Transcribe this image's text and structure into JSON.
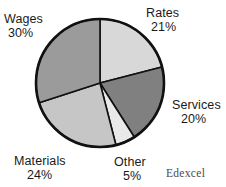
{
  "chart_data": {
    "type": "pie",
    "title": "",
    "subtitle": "",
    "xlabel": "",
    "ylabel": "",
    "legend_position": "none",
    "grid": false,
    "start_angle_deg": 0,
    "direction": "clockwise",
    "center": {
      "x": 100,
      "y": 83
    },
    "radius": 64,
    "categories": [
      "Rates",
      "Services",
      "Other",
      "Materials",
      "Wages"
    ],
    "values": [
      21,
      20,
      5,
      24,
      30
    ],
    "value_suffix": "%",
    "slices": [
      {
        "name": "Rates",
        "value": 21,
        "value_text": "21%",
        "color": "#d8d8d8",
        "label_position": "top-right"
      },
      {
        "name": "Services",
        "value": 20,
        "value_text": "20%",
        "color": "#808080",
        "label_position": "right"
      },
      {
        "name": "Other",
        "value": 5,
        "value_text": "5%",
        "color": "#e9e9e9",
        "label_position": "bottom"
      },
      {
        "name": "Materials",
        "value": 24,
        "value_text": "24%",
        "color": "#c6c6c6",
        "label_position": "bottom-left"
      },
      {
        "name": "Wages",
        "value": 30,
        "value_text": "30%",
        "color": "#9b9b9b",
        "label_position": "top-left"
      }
    ],
    "outline_color": "#111111"
  },
  "labels": {
    "rates": {
      "name": "Rates",
      "value": "21%"
    },
    "services": {
      "name": "Services",
      "value": "20%"
    },
    "other": {
      "name": "Other",
      "value": "5%"
    },
    "materials": {
      "name": "Materials",
      "value": "24%"
    },
    "wages": {
      "name": "Wages",
      "value": "30%"
    }
  },
  "watermark": {
    "text": "Edexcel"
  }
}
